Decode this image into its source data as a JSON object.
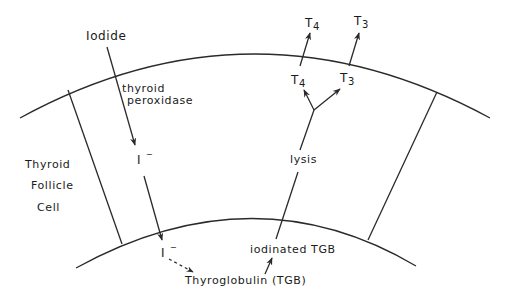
{
  "diagram": {
    "labels": {
      "iodide": "Iodide",
      "enzyme_line1": "thyroid",
      "enzyme_line2": "peroxidase",
      "iodide_ion_upper": "I",
      "iodide_ion_upper_sup": "−",
      "iodide_ion_lower": "I",
      "iodide_ion_lower_sup": "−",
      "cell_line1": "Thyroid",
      "cell_line2": "Follicle",
      "cell_line3": "Cell",
      "thyroglobulin": "Thyroglobulin (TGB)",
      "iodinated": "iodinated TGB",
      "lysis": "lysis",
      "t4_inner": "T",
      "t4_inner_sub": "4",
      "t3_inner": "T",
      "t3_inner_sub": "3",
      "t4_outer": "T",
      "t4_outer_sub": "4",
      "t3_outer": "T",
      "t3_outer_sub": "3"
    },
    "colors": {
      "line": "#2a2a2a",
      "text": "#1a1a1a",
      "background": "#ffffff"
    }
  }
}
